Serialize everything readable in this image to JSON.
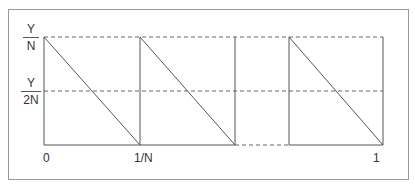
{
  "diagram": {
    "type": "sawtooth-function",
    "y_labels": [
      {
        "numerator": "Y",
        "denominator": "N"
      },
      {
        "numerator": "Y",
        "denominator": "2N"
      }
    ],
    "x_labels": {
      "origin": "0",
      "first": "1/N",
      "last": "1"
    },
    "colors": {
      "line": "#555555",
      "frame": "#888888",
      "text": "#333333"
    }
  }
}
